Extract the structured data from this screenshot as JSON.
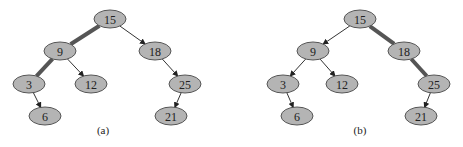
{
  "diagrams": [
    {
      "caption": "(a)",
      "nodes": [
        {
          "id": "n15",
          "label": "15"
        },
        {
          "id": "n9",
          "label": "9"
        },
        {
          "id": "n18",
          "label": "18"
        },
        {
          "id": "n3",
          "label": "3"
        },
        {
          "id": "n12",
          "label": "12"
        },
        {
          "id": "n25",
          "label": "25"
        },
        {
          "id": "n6",
          "label": "6"
        },
        {
          "id": "n21",
          "label": "21"
        }
      ],
      "edges": [
        {
          "from": "n15",
          "to": "n9",
          "highlighted": true
        },
        {
          "from": "n15",
          "to": "n18",
          "highlighted": false
        },
        {
          "from": "n9",
          "to": "n3",
          "highlighted": true
        },
        {
          "from": "n9",
          "to": "n12",
          "highlighted": false
        },
        {
          "from": "n18",
          "to": "n25",
          "highlighted": false
        },
        {
          "from": "n3",
          "to": "n6",
          "highlighted": false
        },
        {
          "from": "n25",
          "to": "n21",
          "highlighted": false
        }
      ]
    },
    {
      "caption": "(b)",
      "nodes": [
        {
          "id": "n15",
          "label": "15"
        },
        {
          "id": "n9",
          "label": "9"
        },
        {
          "id": "n18",
          "label": "18"
        },
        {
          "id": "n3",
          "label": "3"
        },
        {
          "id": "n12",
          "label": "12"
        },
        {
          "id": "n25",
          "label": "25"
        },
        {
          "id": "n6",
          "label": "6"
        },
        {
          "id": "n21",
          "label": "21"
        }
      ],
      "edges": [
        {
          "from": "n15",
          "to": "n9",
          "highlighted": false
        },
        {
          "from": "n15",
          "to": "n18",
          "highlighted": true
        },
        {
          "from": "n9",
          "to": "n3",
          "highlighted": false
        },
        {
          "from": "n9",
          "to": "n12",
          "highlighted": false
        },
        {
          "from": "n18",
          "to": "n25",
          "highlighted": true
        },
        {
          "from": "n3",
          "to": "n6",
          "highlighted": false
        },
        {
          "from": "n25",
          "to": "n21",
          "highlighted": false
        }
      ]
    }
  ]
}
